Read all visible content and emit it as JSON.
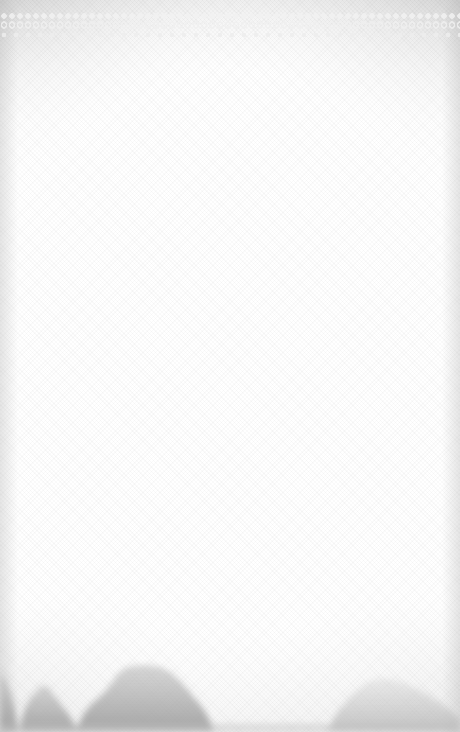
{
  "scene": {
    "type": "textured-paper-background",
    "description": "Blank canvas-textured paper with decorative lace border at top and misty tree silhouettes at bottom",
    "colors": {
      "paper": "#ffffff",
      "top_shade": "#c9c9c9",
      "lace": "#f0f0f0",
      "tree_dark": "#9a9a9a",
      "tree_light": "#bdbdbd"
    },
    "elements": [
      {
        "name": "lace-border",
        "position": "top"
      },
      {
        "name": "tree-silhouettes",
        "position": "bottom",
        "count": 4
      }
    ]
  }
}
